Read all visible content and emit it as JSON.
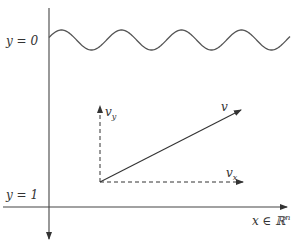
{
  "diagram": {
    "labels": {
      "y0": "y = 0",
      "y1": "y = 1",
      "x_axis": "x ∈ ℝ",
      "x_axis_sup": "n",
      "v": "v",
      "vx_base": "v",
      "vx_sub": "x",
      "vy_base": "v",
      "vy_sub": "y"
    },
    "colors": {
      "stroke": "#333333",
      "wave": "#555555"
    },
    "wave": {
      "cycles": 4,
      "description": "sinusoidal surface at y = 0"
    },
    "vector": {
      "components": [
        "v_x",
        "v_y"
      ],
      "resultant": "v"
    }
  }
}
